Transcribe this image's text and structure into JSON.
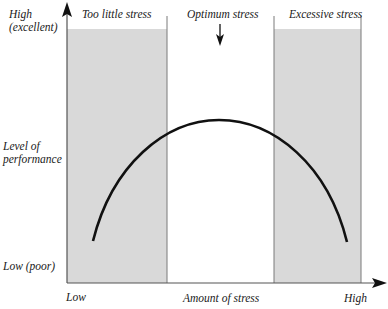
{
  "diagram": {
    "y_axis": {
      "title": "Level of performance",
      "title_line1": "Level of",
      "title_line2": "performance",
      "high_label_line1": "High",
      "high_label_line2": "(excellent)",
      "low_label": "Low (poor)"
    },
    "x_axis": {
      "title": "Amount of stress",
      "low_label": "Low",
      "high_label": "High"
    },
    "zones": [
      {
        "label": "Too little stress",
        "shaded": true
      },
      {
        "label": "Optimum stress",
        "shaded": false,
        "marker": "down-arrow"
      },
      {
        "label": "Excessive stress",
        "shaded": true
      }
    ],
    "curve": {
      "shape": "inverted-U",
      "description": "Performance rises with stress to a peak in the optimum zone, then falls"
    },
    "colors": {
      "shade": "#d9d9d9",
      "lines": "#111111",
      "divider": "#7a7a7a"
    }
  }
}
